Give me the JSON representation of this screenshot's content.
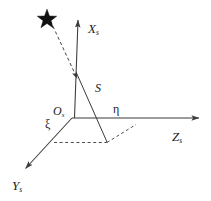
{
  "figure": {
    "type": "3d-coordinate-frame-diagram",
    "background_color": "#ffffff",
    "line_color": "#3a3a3a",
    "text_color": "#1a1a1a"
  },
  "labels": {
    "x_axis": {
      "symbol": "X",
      "subscript": "s"
    },
    "z_axis": {
      "symbol": "Z",
      "subscript": "s"
    },
    "y_axis": {
      "symbol": "Y",
      "subscript": "s"
    },
    "origin": {
      "symbol": "O",
      "subscript": "s"
    },
    "s_vector": {
      "symbol": "S",
      "subscript": ""
    },
    "eta": {
      "symbol": "η",
      "subscript": ""
    },
    "xi": {
      "symbol": "ξ",
      "subscript": ""
    }
  },
  "geometry": {
    "origin": {
      "x": 72,
      "y": 118
    },
    "x_axis_tip": {
      "x": 78,
      "y": 17
    },
    "z_axis_tip": {
      "x": 203,
      "y": 118
    },
    "y_axis_tip": {
      "x": 22,
      "y": 172
    },
    "star_marker": {
      "x": 47,
      "y": 17,
      "points": 5,
      "filled": true
    },
    "sight_line_arrow_tip": {
      "x": 79,
      "y": 83
    },
    "s_vector_foot": {
      "x": 107,
      "y": 142
    },
    "projection_corner_right": {
      "x": 135,
      "y": 125
    },
    "projection_corner_left": {
      "x": 55,
      "y": 142
    }
  },
  "icons": {
    "star": "star-icon",
    "arrowhead": "arrowhead-icon"
  }
}
